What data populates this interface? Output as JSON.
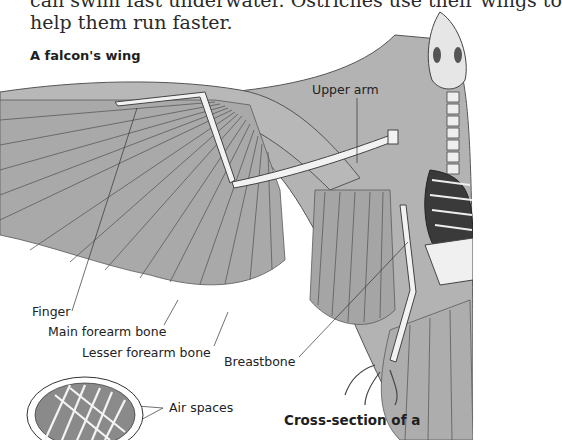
{
  "body_text": {
    "line1": "can swim fast underwater. Ostriches use their wings to",
    "line2": "help them run faster."
  },
  "figure": {
    "title": "A falcon's wing",
    "labels": {
      "upper_arm": "Upper arm",
      "finger": "Finger",
      "main_forearm_bone": "Main forearm bone",
      "lesser_forearm_bone": "Lesser forearm bone",
      "breastbone": "Breastbone",
      "air_spaces": "Air spaces"
    }
  },
  "inset": {
    "caption": "Cross-section of a"
  },
  "colors": {
    "feather": "#a9a9a9",
    "feather_dark": "#7c7c7c",
    "bone": "#f2f2f2",
    "text": "#222222"
  }
}
